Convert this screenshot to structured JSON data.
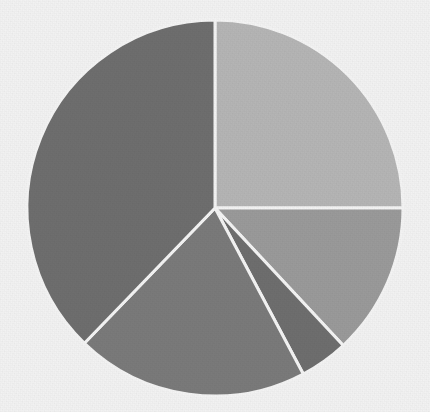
{
  "chart_data": {
    "type": "pie",
    "title": "",
    "subtitle": "",
    "xlabel": "",
    "ylabel": "",
    "grid": false,
    "legend_position": "none",
    "labels_shown": false,
    "start_angle_deg": 0,
    "direction": "clockwise",
    "center": {
      "x": 215,
      "y": 208
    },
    "radius": 188,
    "background_color": "#f2f2f2",
    "separator_color": "#f4f4f4",
    "separator_width": 3,
    "categories": [
      "Slice 1",
      "Slice 2",
      "Slice 3",
      "Slice 4",
      "Slice 5"
    ],
    "values": [
      25,
      13,
      4,
      20,
      38
    ],
    "units": "percent",
    "slices": [
      {
        "name": "Slice 1",
        "value": 25,
        "percent": "25%",
        "color": "#b5b5b5",
        "start_angle_deg": 0,
        "end_angle_deg": 90
      },
      {
        "name": "Slice 2",
        "value": 13,
        "percent": "13%",
        "color": "#9a9a9a",
        "start_angle_deg": 90,
        "end_angle_deg": 137
      },
      {
        "name": "Slice 3",
        "value": 4,
        "percent": "4%",
        "color": "#6e6e6e",
        "start_angle_deg": 137,
        "end_angle_deg": 152
      },
      {
        "name": "Slice 4",
        "value": 20,
        "percent": "20%",
        "color": "#7a7a7a",
        "start_angle_deg": 152,
        "end_angle_deg": 224
      },
      {
        "name": "Slice 5",
        "value": 38,
        "percent": "38%",
        "color": "#6e6e6e",
        "start_angle_deg": 224,
        "end_angle_deg": 360
      }
    ]
  },
  "canvas": {
    "width": 430,
    "height": 412
  }
}
